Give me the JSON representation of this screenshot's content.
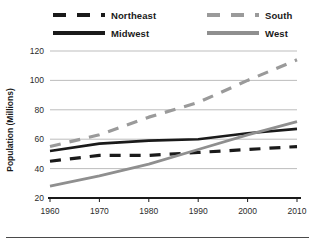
{
  "chart_data": {
    "type": "line",
    "title": "",
    "xlabel": "",
    "ylabel": "Population (Millions)",
    "x": [
      1960,
      1970,
      1980,
      1990,
      2000,
      2010
    ],
    "xtick_labels": [
      "1960",
      "1970",
      "1980",
      "1990",
      "2000",
      "2010"
    ],
    "ytick_labels": [
      "20",
      "40",
      "60",
      "80",
      "100",
      "120"
    ],
    "yticks": [
      20,
      40,
      60,
      80,
      100,
      120
    ],
    "xlim": [
      1960,
      2010
    ],
    "ylim": [
      20,
      120
    ],
    "grid": "horizontal",
    "legend_position": "top",
    "series": [
      {
        "name": "Northeast",
        "values": [
          45,
          49,
          49,
          51,
          53,
          55
        ],
        "color": "#1a1a1a",
        "style": "dashed",
        "width": 3.2
      },
      {
        "name": "Midwest",
        "values": [
          52,
          57,
          59,
          60,
          64,
          67
        ],
        "color": "#1a1a1a",
        "style": "solid",
        "width": 2.6
      },
      {
        "name": "South",
        "values": [
          55,
          63,
          75,
          85,
          100,
          114
        ],
        "color": "#9a9a9a",
        "style": "dashed",
        "width": 3.2
      },
      {
        "name": "West",
        "values": [
          28,
          35,
          43,
          53,
          63,
          72
        ],
        "color": "#8f8f8f",
        "style": "solid",
        "width": 2.8
      }
    ]
  },
  "legend": {
    "entries": [
      {
        "label": "Northeast"
      },
      {
        "label": "Midwest"
      },
      {
        "label": "South"
      },
      {
        "label": "West"
      }
    ]
  },
  "axis": {
    "y_title": "Population (Millions)"
  },
  "colors": {
    "dark": "#1a1a1a",
    "gray": "#9a9a9a",
    "gridline": "#b5b5b5",
    "axis": "#1a1a1a",
    "rule": "#4a4a4a"
  }
}
